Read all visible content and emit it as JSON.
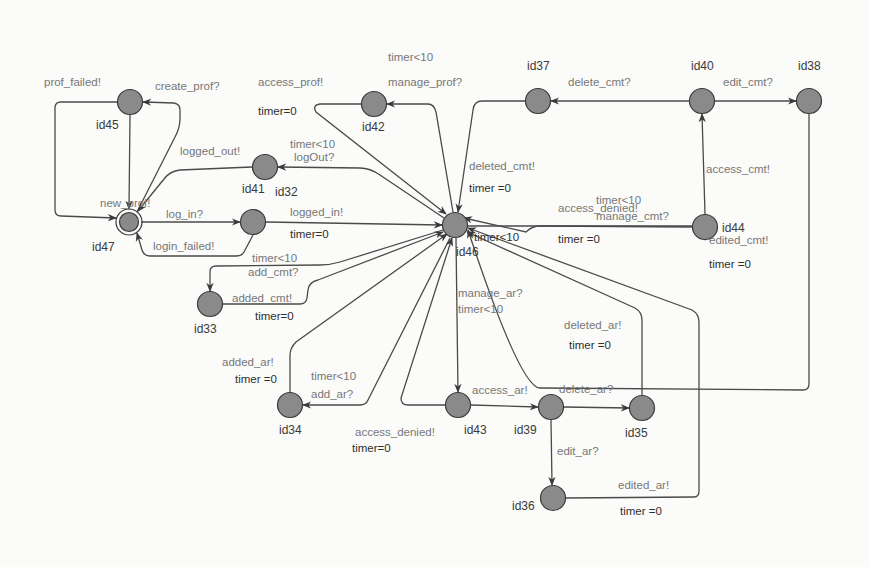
{
  "diagram": {
    "type": "timed-automaton",
    "initial_node": "id47",
    "nodes": [
      {
        "id": "id45",
        "label": "id45",
        "x": 130,
        "y": 102,
        "lx": 96,
        "ly": 129
      },
      {
        "id": "id42",
        "label": "id42",
        "x": 374,
        "y": 104,
        "lx": 362,
        "ly": 131
      },
      {
        "id": "id37",
        "label": "id37",
        "x": 538,
        "y": 101,
        "lx": 527,
        "ly": 70
      },
      {
        "id": "id40",
        "label": "id40",
        "x": 702,
        "y": 101,
        "lx": 691,
        "ly": 70
      },
      {
        "id": "id38",
        "label": "id38",
        "x": 809,
        "y": 101,
        "lx": 798,
        "ly": 70
      },
      {
        "id": "id44",
        "label": "id44",
        "x": 705,
        "y": 227,
        "lx": 722,
        "ly": 232
      },
      {
        "id": "id32",
        "label": "id32",
        "x": 265,
        "y": 167,
        "lx": 275,
        "ly": 196
      },
      {
        "id": "id41",
        "label": "id41",
        "x": 253,
        "y": 222,
        "lx": 242,
        "ly": 193
      },
      {
        "id": "id47",
        "label": "id47",
        "x": 129,
        "y": 222,
        "lx": 92,
        "ly": 251
      },
      {
        "id": "id46",
        "label": "id46",
        "x": 455,
        "y": 225,
        "lx": 456,
        "ly": 256
      },
      {
        "id": "id33",
        "label": "id33",
        "x": 210,
        "y": 304,
        "lx": 194,
        "ly": 333
      },
      {
        "id": "id34",
        "label": "id34",
        "x": 290,
        "y": 405,
        "lx": 279,
        "ly": 434
      },
      {
        "id": "id43",
        "label": "id43",
        "x": 458,
        "y": 405,
        "lx": 464,
        "ly": 434
      },
      {
        "id": "id39",
        "label": "id39",
        "x": 551,
        "y": 407,
        "lx": 514,
        "ly": 434
      },
      {
        "id": "id35",
        "label": "id35",
        "x": 642,
        "y": 408,
        "lx": 625,
        "ly": 437
      },
      {
        "id": "id36",
        "label": "id36",
        "x": 553,
        "y": 498,
        "lx": 512,
        "ly": 510
      }
    ],
    "invariants": [
      {
        "node": "id46",
        "text": "timer<10",
        "x": 474,
        "y": 241
      }
    ],
    "edges": [
      {
        "id": "e1",
        "from": "id47",
        "to": "id41",
        "path": "M141,222 L240,222",
        "labels": [
          {
            "text": "log_in?",
            "kind": "sync",
            "x": 166,
            "y": 218
          }
        ]
      },
      {
        "id": "e2",
        "from": "id41",
        "to": "id47",
        "path": "M253,235 L244,252 Q242,256 236,256 L150,256 Q144,256 142,250 L137,233",
        "labels": [
          {
            "text": "login_failed!",
            "kind": "sync",
            "x": 153,
            "y": 250
          }
        ]
      },
      {
        "id": "e3",
        "from": "id41",
        "to": "id46",
        "path": "M266,222 L442,225",
        "labels": [
          {
            "text": "logged_in!",
            "kind": "sync",
            "x": 290,
            "y": 216
          },
          {
            "text": "timer=0",
            "kind": "assign",
            "x": 290,
            "y": 238
          }
        ]
      },
      {
        "id": "e4",
        "from": "id45",
        "to": "id47",
        "path": "M130,115 L129,209",
        "labels": [
          {
            "text": "new_prof!",
            "kind": "sync",
            "x": 100,
            "y": 207
          }
        ]
      },
      {
        "id": "e5",
        "from": "id45",
        "to": "id47",
        "path": "M117,102 L61,102 Q55,102 55,108 L55,210 Q55,216 61,216 L116,218",
        "labels": [
          {
            "text": "prof_failed!",
            "kind": "sync",
            "x": 44,
            "y": 86
          }
        ]
      },
      {
        "id": "e6",
        "from": "id47",
        "to": "id45",
        "path": "M137,212 L175,137 Q180,128 180,118 L180,110 Q180,104 174,103 L143,102",
        "labels": [
          {
            "text": "create_prof?",
            "kind": "sync",
            "x": 155,
            "y": 90
          }
        ]
      },
      {
        "id": "e7",
        "from": "id32",
        "to": "id47",
        "path": "M252,167 L180,170 Q170,171 164,179 L138,211",
        "labels": [
          {
            "text": "logged_out!",
            "kind": "sync",
            "x": 180,
            "y": 155
          }
        ]
      },
      {
        "id": "e8",
        "from": "id46",
        "to": "id32",
        "path": "M444,218 L380,175 Q370,168 360,168 L278,167",
        "labels": [
          {
            "text": "timer<10",
            "kind": "guard",
            "x": 290,
            "y": 148
          },
          {
            "text": "logOut?",
            "kind": "sync",
            "x": 294,
            "y": 161
          }
        ]
      },
      {
        "id": "e9",
        "from": "id42",
        "to": "id46",
        "path": "M361,104 L320,104 Q312,105 316,112 L446,214",
        "labels": [
          {
            "text": "access_prof!",
            "kind": "sync",
            "x": 258,
            "y": 86
          },
          {
            "text": "timer=0",
            "kind": "assign",
            "x": 258,
            "y": 115
          }
        ]
      },
      {
        "id": "e10",
        "from": "id46",
        "to": "id42",
        "path": "M453,212 L436,112 Q434,104 428,104 L387,104",
        "labels": [
          {
            "text": "timer<10",
            "kind": "guard",
            "x": 388,
            "y": 61
          },
          {
            "text": "manage_prof?",
            "kind": "sync",
            "x": 388,
            "y": 86
          }
        ]
      },
      {
        "id": "e11",
        "from": "id37",
        "to": "id46",
        "path": "M525,101 L482,101 Q474,101 473,110 L458,212",
        "labels": [
          {
            "text": "deleted_cmt!",
            "kind": "sync",
            "x": 469,
            "y": 170
          },
          {
            "text": "timer =0",
            "kind": "assign",
            "x": 469,
            "y": 192
          }
        ]
      },
      {
        "id": "e12",
        "from": "id40",
        "to": "id37",
        "path": "M689,101 L551,101",
        "labels": [
          {
            "text": "delete_cmt?",
            "kind": "sync",
            "x": 568,
            "y": 86
          }
        ]
      },
      {
        "id": "e13",
        "from": "id40",
        "to": "id38",
        "path": "M715,101 L796,101",
        "labels": [
          {
            "text": "edit_cmt?",
            "kind": "sync",
            "x": 723,
            "y": 86
          }
        ]
      },
      {
        "id": "e14",
        "from": "id44",
        "to": "id40",
        "path": "M705,214 L702,114",
        "labels": [
          {
            "text": "access_cmt!",
            "kind": "sync",
            "x": 706,
            "y": 173
          }
        ]
      },
      {
        "id": "e15",
        "from": "id44",
        "to": "id46",
        "path": "M692,227 L540,226 Q532,226 526,232 L464,218",
        "labels": [
          {
            "text": "access_denied!",
            "kind": "sync",
            "x": 558,
            "y": 212
          },
          {
            "text": "timer =0",
            "kind": "assign",
            "x": 558,
            "y": 243
          }
        ]
      },
      {
        "id": "e16",
        "from": "id46",
        "to": "id44",
        "path": "M468,226 L700,226 Q705,226 705,220 L705,240",
        "labels": [
          {
            "text": "timer<10",
            "kind": "guard",
            "x": 596,
            "y": 204
          },
          {
            "text": "manage_cmt?",
            "kind": "sync",
            "x": 596,
            "y": 220
          }
        ]
      },
      {
        "id": "e17",
        "from": "id38",
        "to": "id46",
        "path": "M809,114 L809,384 Q809,390 803,390 L540,388 Q520,388 468,230",
        "labels": [
          {
            "text": "edited_cmt!",
            "kind": "sync",
            "x": 709,
            "y": 244
          },
          {
            "text": "timer =0",
            "kind": "assign",
            "x": 709,
            "y": 268
          }
        ]
      },
      {
        "id": "e18",
        "from": "id46",
        "to": "id33",
        "path": "M443,230 L340,262 Q330,265 320,265 L216,266 Q210,266 210,272 L210,291",
        "labels": [
          {
            "text": "timer<10",
            "kind": "guard",
            "x": 252,
            "y": 262
          },
          {
            "text": "add_cmt?",
            "kind": "sync",
            "x": 248,
            "y": 276
          }
        ]
      },
      {
        "id": "e19",
        "from": "id33",
        "to": "id46",
        "path": "M223,304 L300,304 Q306,304 307,298 L308,290 Q309,282 318,280 L443,232",
        "labels": [
          {
            "text": "added_cmt!",
            "kind": "sync",
            "x": 232,
            "y": 302
          },
          {
            "text": "timer=0",
            "kind": "assign",
            "x": 255,
            "y": 320
          }
        ]
      },
      {
        "id": "e20",
        "from": "id34",
        "to": "id46",
        "path": "M290,392 L290,355 Q290,348 296,342 L447,234",
        "labels": [
          {
            "text": "added_ar!",
            "kind": "sync",
            "x": 222,
            "y": 366
          },
          {
            "text": "timer =0",
            "kind": "assign",
            "x": 235,
            "y": 383
          }
        ]
      },
      {
        "id": "e21",
        "from": "id46",
        "to": "id34",
        "path": "M450,238 L368,400 Q366,405 360,405 L303,405",
        "labels": [
          {
            "text": "timer<10",
            "kind": "guard",
            "x": 311,
            "y": 380
          },
          {
            "text": "add_ar?",
            "kind": "sync",
            "x": 311,
            "y": 398
          }
        ]
      },
      {
        "id": "e22",
        "from": "id43",
        "to": "id46",
        "path": "M445,405 L408,405 Q401,405 401,398 L452,238",
        "labels": [
          {
            "text": "access_denied!",
            "kind": "sync",
            "x": 355,
            "y": 436
          },
          {
            "text": "timer=0",
            "kind": "assign",
            "x": 352,
            "y": 452
          }
        ]
      },
      {
        "id": "e23",
        "from": "id46",
        "to": "id43",
        "path": "M456,238 L458,392",
        "labels": [
          {
            "text": "manage_ar?",
            "kind": "sync",
            "x": 458,
            "y": 297
          },
          {
            "text": "timer<10",
            "kind": "guard",
            "x": 458,
            "y": 313
          }
        ]
      },
      {
        "id": "e24",
        "from": "id43",
        "to": "id39",
        "path": "M471,405 L538,407",
        "labels": [
          {
            "text": "access_ar!",
            "kind": "sync",
            "x": 472,
            "y": 394
          }
        ]
      },
      {
        "id": "e25",
        "from": "id39",
        "to": "id35",
        "path": "M564,407 L629,408",
        "labels": [
          {
            "text": "delete_ar?",
            "kind": "sync",
            "x": 559,
            "y": 393
          }
        ]
      },
      {
        "id": "e26",
        "from": "id35",
        "to": "id46",
        "path": "M642,395 L642,320 Q642,312 635,308 L467,232",
        "labels": [
          {
            "text": "deleted_ar!",
            "kind": "sync",
            "x": 564,
            "y": 329
          },
          {
            "text": "timer =0",
            "kind": "assign",
            "x": 569,
            "y": 349
          }
        ]
      },
      {
        "id": "e27",
        "from": "id39",
        "to": "id36",
        "path": "M551,420 L552,485",
        "labels": [
          {
            "text": "edit_ar?",
            "kind": "sync",
            "x": 557,
            "y": 455
          }
        ]
      },
      {
        "id": "e28",
        "from": "id36",
        "to": "id46",
        "path": "M566,498 L694,497 Q699,497 699,491 L699,322 Q699,314 692,310 L468,228",
        "labels": [
          {
            "text": "edited_ar!",
            "kind": "sync",
            "x": 618,
            "y": 489
          },
          {
            "text": "timer =0",
            "kind": "assign",
            "x": 620,
            "y": 515
          }
        ]
      }
    ]
  },
  "colors": {
    "background": "#fbfbfa",
    "node_fill": "#8a8a8a",
    "node_stroke": "#3a3a3a",
    "edge": "#4a4a4a",
    "sync_label": "#777777",
    "assign_label": "#2e2e2e"
  }
}
